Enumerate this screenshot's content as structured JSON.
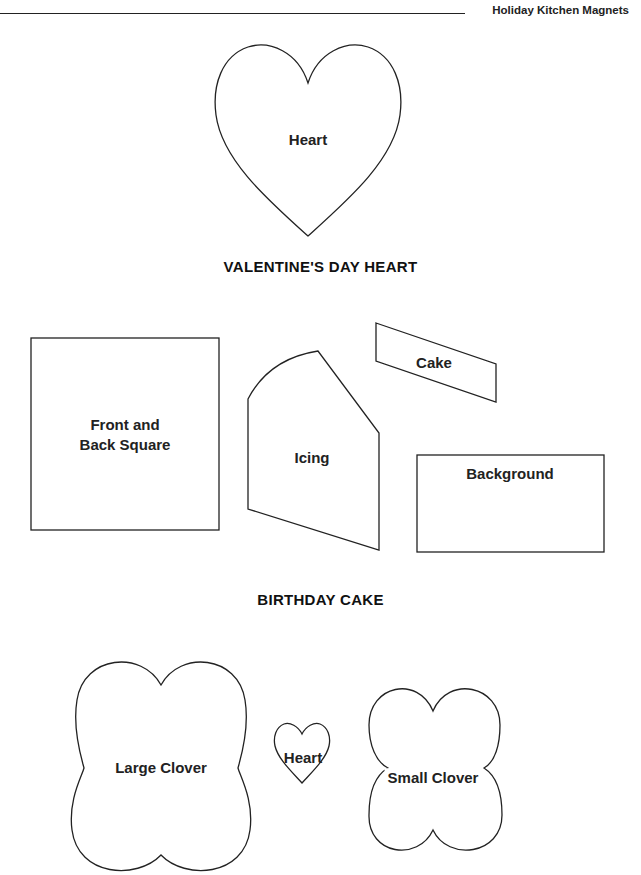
{
  "header": {
    "title": "Holiday Kitchen Magnets"
  },
  "sections": [
    {
      "caption": "VALENTINE'S DAY HEART",
      "pieces": [
        {
          "label": "Heart",
          "shape": "heart"
        }
      ]
    },
    {
      "caption": "BIRTHDAY CAKE",
      "pieces": [
        {
          "label_line1": "Front and",
          "label_line2": "Back Square",
          "shape": "rectangle"
        },
        {
          "label": "Icing",
          "shape": "arched-polygon"
        },
        {
          "label": "Cake",
          "shape": "parallelogram"
        },
        {
          "label": "Background",
          "shape": "rectangle"
        }
      ]
    },
    {
      "caption": "",
      "pieces": [
        {
          "label": "Large Clover",
          "shape": "clover"
        },
        {
          "label": "Heart",
          "shape": "heart"
        },
        {
          "label": "Small Clover",
          "shape": "clover"
        }
      ]
    }
  ],
  "colors": {
    "outline": "#222222",
    "background": "#ffffff"
  }
}
